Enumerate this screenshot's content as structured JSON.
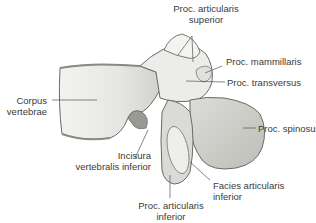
{
  "figure": {
    "colors": {
      "background": "#ffffff",
      "bone_fill": "#e9e9e6",
      "bone_shade": "#c9c9c4",
      "bone_outline": "#6a6a66",
      "leader_line": "#555555",
      "label_text": "#3a3a3a"
    },
    "labels": [
      {
        "id": "proc-articularis-superior",
        "lines": [
          "Proc. articularis",
          "superior"
        ]
      },
      {
        "id": "proc-mammillaris",
        "lines": [
          "Proc. mammillaris"
        ]
      },
      {
        "id": "proc-transversus",
        "lines": [
          "Proc. transversus"
        ]
      },
      {
        "id": "corpus-vertebrae",
        "lines": [
          "Corpus",
          "vertebrae"
        ]
      },
      {
        "id": "proc-spinosus",
        "lines": [
          "Proc. spinosus"
        ]
      },
      {
        "id": "incisura-vertebralis-inferior",
        "lines": [
          "Incisura",
          "vertebralis inferior"
        ]
      },
      {
        "id": "facies-articularis-inferior",
        "lines": [
          "Facies articularis",
          "inferior"
        ]
      },
      {
        "id": "proc-articularis-inferior",
        "lines": [
          "Proc. articularis",
          "inferior"
        ]
      }
    ]
  }
}
